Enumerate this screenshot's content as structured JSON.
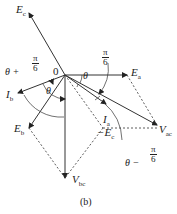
{
  "figure": {
    "caption": "(b)",
    "origin_label": "0",
    "phasors": [
      {
        "id": "Ea",
        "symbol": "E",
        "sub": "a",
        "style": "solid"
      },
      {
        "id": "Ec",
        "symbol": "E",
        "sub": "c",
        "style": "solid"
      },
      {
        "id": "Eb",
        "symbol": "E",
        "sub": "b",
        "style": "solid"
      },
      {
        "id": "Ib",
        "symbol": "I",
        "sub": "b",
        "style": "solid"
      },
      {
        "id": "Ia",
        "symbol": "I",
        "sub": "a",
        "style": "solid"
      },
      {
        "id": "Vbc",
        "symbol": "V",
        "sub": "bc",
        "style": "solid"
      },
      {
        "id": "Vac",
        "symbol": "V",
        "sub": "ac",
        "style": "solid"
      },
      {
        "id": "negEc",
        "symbol": "−E",
        "sub": "c",
        "style": "dashed"
      }
    ],
    "angles": {
      "theta": "θ",
      "pi_over_6": {
        "num": "π",
        "den": "6"
      },
      "theta_plus": {
        "prefix": "θ +",
        "num": "π",
        "den": "6"
      },
      "theta_minus": {
        "prefix": "θ −",
        "num": "π",
        "den": "6"
      }
    }
  }
}
